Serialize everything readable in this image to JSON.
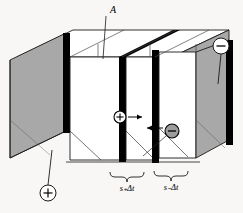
{
  "figure": {
    "type": "physics-diagram",
    "background_color": "#f8f7f5",
    "face_gray": "#a8a8a8",
    "face_white": "#ffffff",
    "stroke_color": "#1a1a1a",
    "thick_edge_color": "#000000"
  },
  "labels": {
    "area_label": "A",
    "positive_drift_label": "s₊Δt",
    "negative_drift_label": "s₋Δt",
    "positive_charge_symbol": "+",
    "negative_charge_symbol": "−",
    "positive_terminal_symbol": "+",
    "negative_terminal_symbol": "−"
  },
  "annotations": {
    "area_callout": {
      "name": "cross-sectional-area-A",
      "text": "A",
      "x": 110,
      "y": 12
    },
    "positive_drift_brace": {
      "name": "positive-drift-distance",
      "text": "s₊Δt",
      "x": 127,
      "y": 186
    },
    "negative_drift_brace": {
      "name": "negative-drift-distance",
      "text": "s₋Δt",
      "x": 171,
      "y": 185
    }
  },
  "carriers": [
    {
      "name": "positive-charge-carrier",
      "sign": "+",
      "fill": "#ffffff",
      "cx": 120,
      "cy": 117,
      "r": 6,
      "arrow_direction": "right"
    },
    {
      "name": "negative-charge-carrier",
      "sign": "−",
      "fill": "#9c9c9c",
      "cx": 172,
      "cy": 131,
      "r": 7,
      "arrow_direction": "left"
    }
  ],
  "terminals": [
    {
      "name": "negative-terminal",
      "sign": "−",
      "cx": 221,
      "cy": 46,
      "r": 8
    },
    {
      "name": "positive-terminal",
      "sign": "+",
      "cx": 48,
      "cy": 193,
      "r": 8
    }
  ]
}
